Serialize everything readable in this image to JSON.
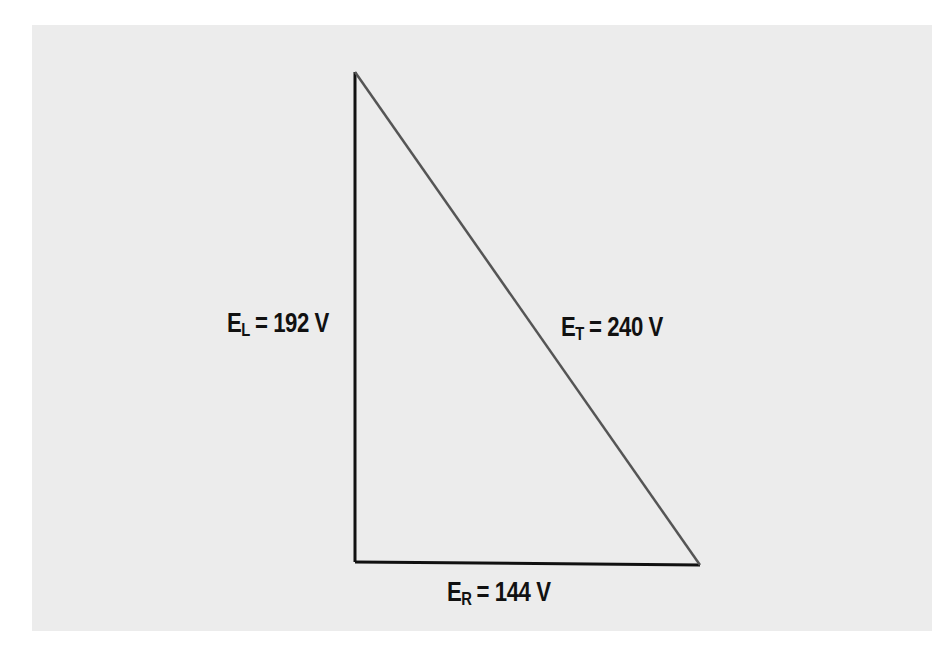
{
  "diagram": {
    "type": "voltage-triangle",
    "background_color": "#ececec",
    "line_color": "#111111",
    "hypotenuse_color": "#555555",
    "vertices": {
      "top": [
        355,
        72
      ],
      "bottom_left": [
        355,
        562
      ],
      "bottom_right": [
        700,
        565
      ]
    },
    "labels": {
      "inductive": {
        "symbol": "E",
        "subscript": "L",
        "value": "= 192 V"
      },
      "total": {
        "symbol": "E",
        "subscript": "T",
        "value": "= 240 V"
      },
      "resistive": {
        "symbol": "E",
        "subscript": "R",
        "value": "= 144 V"
      }
    }
  }
}
